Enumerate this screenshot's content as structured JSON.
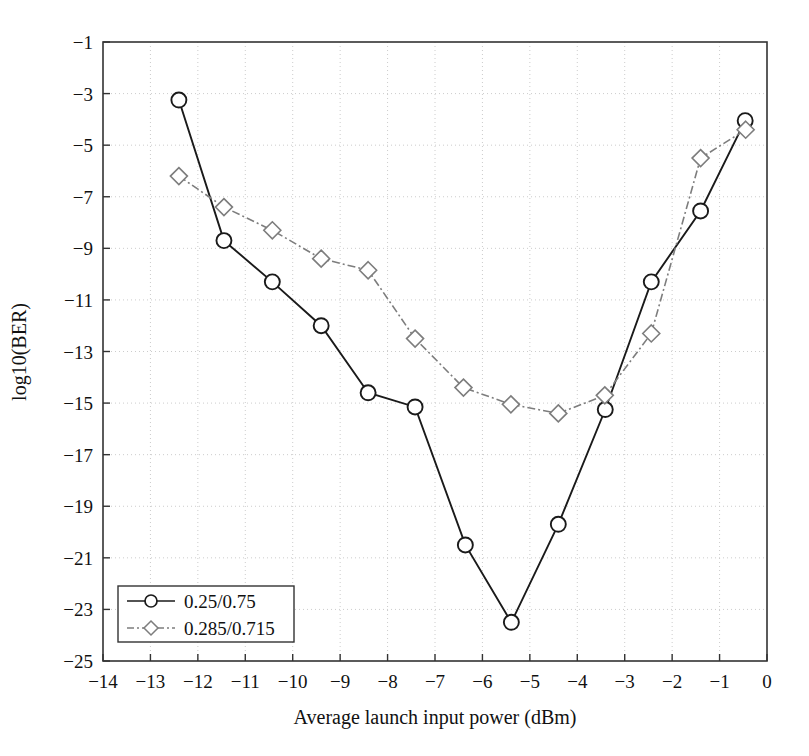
{
  "chart_data": {
    "type": "line",
    "title": "",
    "xlabel": "Average launch input power (dBm)",
    "ylabel": "log10(BER)",
    "xlim": [
      -14,
      0
    ],
    "ylim": [
      -25,
      -1
    ],
    "xticks": [
      "-14",
      "-13",
      "-12",
      "-11",
      "-10",
      "-9",
      "-8",
      "-7",
      "-6",
      "-5",
      "-4",
      "-3",
      "-2",
      "-1",
      "0"
    ],
    "yticks": [
      "-25",
      "-23",
      "-21",
      "-19",
      "-17",
      "-15",
      "-13",
      "-11",
      "-9",
      "-7",
      "-5",
      "-3",
      "-1"
    ],
    "grid": true,
    "legend_position": "lower left",
    "series": [
      {
        "name": "0.25/0.75",
        "marker": "circle",
        "linestyle": "solid",
        "color": "#1a1a1a",
        "points": [
          {
            "x": -12.4,
            "y": -3.25
          },
          {
            "x": -11.45,
            "y": -8.7
          },
          {
            "x": -10.43,
            "y": -10.3
          },
          {
            "x": -9.4,
            "y": -12.0
          },
          {
            "x": -8.41,
            "y": -14.6
          },
          {
            "x": -7.42,
            "y": -15.15
          },
          {
            "x": -6.36,
            "y": -20.5
          },
          {
            "x": -5.39,
            "y": -23.5
          },
          {
            "x": -4.4,
            "y": -19.7
          },
          {
            "x": -3.41,
            "y": -15.25
          },
          {
            "x": -2.44,
            "y": -10.3
          },
          {
            "x": -1.4,
            "y": -7.55
          },
          {
            "x": -0.46,
            "y": -4.05
          }
        ]
      },
      {
        "name": "0.285/0.715",
        "marker": "diamond",
        "linestyle": "dashdot",
        "color": "#7d7d7d",
        "points": [
          {
            "x": -12.4,
            "y": -6.2
          },
          {
            "x": -11.45,
            "y": -7.4
          },
          {
            "x": -10.43,
            "y": -8.3
          },
          {
            "x": -9.4,
            "y": -9.4
          },
          {
            "x": -8.41,
            "y": -9.85
          },
          {
            "x": -7.42,
            "y": -12.5
          },
          {
            "x": -6.4,
            "y": -14.4
          },
          {
            "x": -5.4,
            "y": -15.05
          },
          {
            "x": -4.4,
            "y": -15.4
          },
          {
            "x": -3.42,
            "y": -14.7
          },
          {
            "x": -2.44,
            "y": -12.3
          },
          {
            "x": -1.4,
            "y": -5.5
          },
          {
            "x": -0.45,
            "y": -4.4
          }
        ]
      }
    ]
  },
  "legend": {
    "items": [
      {
        "label": "0.25/0.75"
      },
      {
        "label": "0.285/0.715"
      }
    ]
  }
}
